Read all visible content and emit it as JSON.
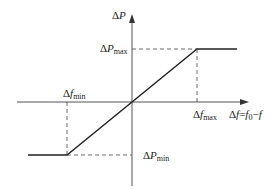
{
  "diagram": {
    "type": "piecewise-linear characteristic",
    "y_axis_label": "ΔP",
    "x_axis_label": "Δf=f0−f",
    "labels": {
      "p_max": "ΔPmax",
      "p_min": "ΔPmin",
      "f_max": "Δfmax",
      "f_min": "Δfmin"
    },
    "label_parts": {
      "y_axis": {
        "delta": "Δ",
        "var": "P"
      },
      "x_axis": {
        "delta": "Δ",
        "var": "f",
        "eq": "=",
        "f0": "f",
        "f0_sub": "0",
        "minus": "−",
        "f": "f"
      },
      "p_max": {
        "delta": "Δ",
        "var": "P",
        "sub": "max"
      },
      "p_min": {
        "delta": "Δ",
        "var": "P",
        "sub": "min"
      },
      "f_max": {
        "delta": "Δ",
        "var": "f",
        "sub": "max"
      },
      "f_min": {
        "delta": "Δ",
        "var": "f",
        "sub": "min"
      }
    },
    "colors": {
      "axis": "#555555",
      "curve": "#222222",
      "dashed": "#444444",
      "text": "#222222"
    }
  }
}
